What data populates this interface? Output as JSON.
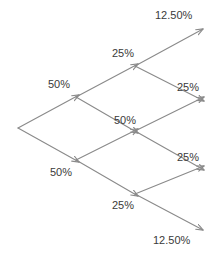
{
  "diagram": {
    "type": "binomial-probability-lattice",
    "stroke_color": "#8a8a8a",
    "text_color": "#3a3a3a",
    "background_color": "#ffffff",
    "width": 216,
    "height": 257,
    "labels": [
      {
        "id": "terminal-up-up",
        "text": "12.50%",
        "x": 155,
        "y": 9
      },
      {
        "id": "branch-up-up",
        "text": "25%",
        "x": 112,
        "y": 47
      },
      {
        "id": "branch-up",
        "text": "50%",
        "x": 48,
        "y": 78
      },
      {
        "id": "terminal-mid-up",
        "text": "25%",
        "x": 177,
        "y": 81
      },
      {
        "id": "branch-middle",
        "text": "50%",
        "x": 114,
        "y": 114
      },
      {
        "id": "terminal-mid-dn",
        "text": "25%",
        "x": 177,
        "y": 151
      },
      {
        "id": "branch-down",
        "text": "50%",
        "x": 50,
        "y": 166
      },
      {
        "id": "branch-dn-dn",
        "text": "25%",
        "x": 112,
        "y": 199
      },
      {
        "id": "terminal-dn-dn",
        "text": "12.50%",
        "x": 153,
        "y": 234
      }
    ],
    "nodes": [
      {
        "id": "root",
        "x": 18,
        "y": 128
      },
      {
        "id": "up",
        "x": 76,
        "y": 97
      },
      {
        "id": "down",
        "x": 76,
        "y": 160
      },
      {
        "id": "up-up",
        "x": 135,
        "y": 66
      },
      {
        "id": "middle",
        "x": 135,
        "y": 131
      },
      {
        "id": "down-down",
        "x": 135,
        "y": 194
      },
      {
        "id": "end-top",
        "x": 201,
        "y": 31
      },
      {
        "id": "end-upper",
        "x": 202,
        "y": 99
      },
      {
        "id": "end-lower",
        "x": 202,
        "y": 168
      },
      {
        "id": "end-bottom",
        "x": 201,
        "y": 228
      }
    ],
    "edges": [
      {
        "id": "root-to-up",
        "from": "root",
        "to": "up",
        "probability": "50%"
      },
      {
        "id": "root-to-down",
        "from": "root",
        "to": "down",
        "probability": "50%"
      },
      {
        "id": "up-to-up-up",
        "from": "up",
        "to": "up-up",
        "probability": "25%"
      },
      {
        "id": "up-to-middle",
        "from": "up",
        "to": "middle",
        "probability": "50%"
      },
      {
        "id": "down-to-middle",
        "from": "down",
        "to": "middle",
        "probability": "50%"
      },
      {
        "id": "down-to-down-down",
        "from": "down",
        "to": "down-down",
        "probability": "25%"
      },
      {
        "id": "up-up-to-end-top",
        "from": "up-up",
        "to": "end-top",
        "probability": "12.50%"
      },
      {
        "id": "up-up-to-end-upper",
        "from": "up-up",
        "to": "end-upper",
        "probability": "25%"
      },
      {
        "id": "middle-to-end-upper",
        "from": "middle",
        "to": "end-upper",
        "probability": "25%"
      },
      {
        "id": "middle-to-end-lower",
        "from": "middle",
        "to": "end-lower",
        "probability": "25%"
      },
      {
        "id": "down-down-to-end-lower",
        "from": "down-down",
        "to": "end-lower",
        "probability": "25%"
      },
      {
        "id": "down-down-to-end-bot",
        "from": "down-down",
        "to": "end-bottom",
        "probability": "12.50%"
      }
    ]
  }
}
